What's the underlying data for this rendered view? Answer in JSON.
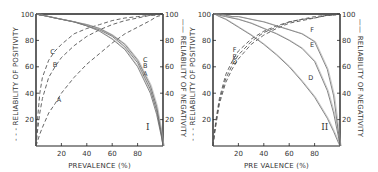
{
  "chart_data": [
    {
      "type": "line",
      "panel_label": "I",
      "title": "",
      "xlabel": "PREVALENCE (%)",
      "ylabel_left": "RELIABILITY OF POSITIVITY",
      "ylabel_left_marker": "- - -",
      "ylabel_right": "RELIABILITY OF NEGATIVITY",
      "ylabel_right_marker": "——",
      "xlim": [
        0,
        100
      ],
      "ylim": [
        0,
        100
      ],
      "xticks": [
        "20",
        "40",
        "60",
        "80"
      ],
      "yticks": [
        "20",
        "40",
        "60",
        "80",
        "100"
      ],
      "grid": false,
      "x": [
        0,
        1,
        3,
        5,
        10,
        15,
        20,
        30,
        40,
        50,
        60,
        70,
        80,
        90,
        95,
        99,
        100
      ],
      "series": [
        {
          "name": "A",
          "kind": "reliability_of_positivity",
          "style": "dashed",
          "values": [
            0,
            3,
            9,
            14,
            25,
            32,
            40,
            52,
            62,
            70,
            78,
            85,
            90,
            95,
            98,
            99,
            100
          ],
          "label_pos": [
            18,
            33
          ]
        },
        {
          "name": "B",
          "kind": "reliability_of_positivity",
          "style": "dashed",
          "values": [
            0,
            10,
            25,
            36,
            52,
            60,
            67,
            76,
            83,
            88,
            92,
            95,
            97,
            99,
            99,
            100,
            100
          ],
          "label_pos": [
            15,
            60
          ]
        },
        {
          "name": "C",
          "kind": "reliability_of_positivity",
          "style": "dashed",
          "values": [
            0,
            18,
            40,
            52,
            65,
            72,
            77,
            85,
            89,
            92,
            95,
            97,
            98,
            99,
            100,
            100,
            100
          ],
          "label_pos": [
            13,
            70
          ]
        },
        {
          "name": "A",
          "kind": "reliability_of_negativity",
          "style": "solid",
          "values": [
            100,
            100,
            99,
            99,
            98,
            97,
            96,
            94,
            91,
            87,
            81,
            73,
            60,
            40,
            24,
            6,
            0
          ],
          "label_pos": [
            86,
            53
          ]
        },
        {
          "name": "B",
          "kind": "reliability_of_negativity",
          "style": "solid",
          "values": [
            100,
            100,
            99,
            99,
            98,
            97,
            96,
            94,
            91,
            88,
            83,
            75,
            63,
            43,
            27,
            7,
            0
          ],
          "label_pos": [
            86,
            59
          ]
        },
        {
          "name": "C",
          "kind": "reliability_of_negativity",
          "style": "solid",
          "values": [
            100,
            100,
            100,
            99,
            98,
            97,
            96,
            94,
            92,
            89,
            84,
            77,
            65,
            46,
            30,
            8,
            0
          ],
          "label_pos": [
            86,
            64
          ]
        }
      ]
    },
    {
      "type": "line",
      "panel_label": "II",
      "title": "",
      "xlabel": "PRE VALENCE (%)",
      "ylabel_left": "RELIABILITY OF POSITIVITY",
      "ylabel_left_marker": "- - -",
      "ylabel_right": "RELIABILITY OF NEGATIVITY",
      "ylabel_right_marker": "——",
      "xlim": [
        0,
        100
      ],
      "ylim": [
        0,
        100
      ],
      "xticks": [
        "20",
        "40",
        "60",
        "80"
      ],
      "yticks": [
        "20",
        "40",
        "60",
        "80",
        "100"
      ],
      "grid": false,
      "x": [
        0,
        1,
        3,
        5,
        10,
        15,
        20,
        30,
        40,
        50,
        60,
        70,
        80,
        90,
        95,
        99,
        100
      ],
      "series": [
        {
          "name": "D",
          "kind": "reliability_of_positivity",
          "style": "dashed",
          "values": [
            0,
            8,
            20,
            32,
            48,
            58,
            66,
            77,
            84,
            89,
            93,
            95,
            97,
            99,
            99,
            100,
            100
          ],
          "label_pos": [
            17,
            62
          ]
        },
        {
          "name": "E",
          "kind": "reliability_of_positivity",
          "style": "dashed",
          "values": [
            0,
            9,
            22,
            34,
            51,
            61,
            69,
            79,
            86,
            90,
            94,
            96,
            97,
            99,
            99,
            100,
            100
          ],
          "label_pos": [
            17,
            66
          ]
        },
        {
          "name": "F",
          "kind": "reliability_of_positivity",
          "style": "dashed",
          "values": [
            0,
            10,
            24,
            36,
            54,
            64,
            72,
            81,
            87,
            91,
            94,
            96,
            98,
            99,
            100,
            100,
            100
          ],
          "label_pos": [
            17,
            71
          ]
        },
        {
          "name": "D",
          "kind": "reliability_of_negativity",
          "style": "solid",
          "values": [
            100,
            100,
            99,
            98,
            96,
            93,
            90,
            84,
            77,
            69,
            60,
            49,
            37,
            21,
            11,
            2,
            0
          ],
          "label_pos": [
            77,
            50
          ]
        },
        {
          "name": "E",
          "kind": "reliability_of_negativity",
          "style": "solid",
          "values": [
            100,
            100,
            100,
            99,
            98,
            97,
            96,
            93,
            89,
            85,
            80,
            74,
            64,
            42,
            25,
            6,
            0
          ],
          "label_pos": [
            78,
            75
          ]
        },
        {
          "name": "F",
          "kind": "reliability_of_negativity",
          "style": "solid",
          "values": [
            100,
            100,
            100,
            100,
            99,
            98,
            98,
            96,
            94,
            91,
            88,
            85,
            79,
            58,
            38,
            9,
            0
          ],
          "label_pos": [
            78,
            86
          ]
        }
      ]
    }
  ],
  "panels": [
    {
      "roman": "I",
      "xlabel": "PREVALENCE (%)",
      "left_label": "- - - RELIABILITY OF POSITIVITY",
      "right_label": "—— RELIABILITY OF NEGATIVITY"
    },
    {
      "roman": "II",
      "xlabel": "PRE VALENCE (%)",
      "left_label": "- - - RELIABILITY OF POSITIVITY",
      "right_label": "—— RELIABILITY OF NEGATIVITY"
    }
  ],
  "colors": {
    "axis": "#222222",
    "dashed": "#555555",
    "solid": "#666666",
    "background": "#ffffff"
  }
}
